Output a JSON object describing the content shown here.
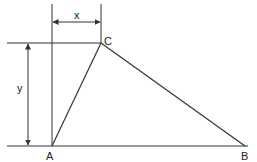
{
  "diagram": {
    "type": "geometry-triangle",
    "stroke_color": "#333333",
    "background": "#ffffff",
    "vertices": [
      {
        "name": "A",
        "label": "A",
        "x": 52,
        "y": 146
      },
      {
        "name": "B",
        "label": "B",
        "x": 245,
        "y": 146
      },
      {
        "name": "C",
        "label": "C",
        "x": 101,
        "y": 43
      }
    ],
    "edges": [
      "AB",
      "BC",
      "CA"
    ],
    "dimensions": [
      {
        "name": "x",
        "label": "x",
        "description": "horizontal offset of C from A"
      },
      {
        "name": "y",
        "label": "y",
        "description": "vertical height of C above AB"
      }
    ]
  }
}
